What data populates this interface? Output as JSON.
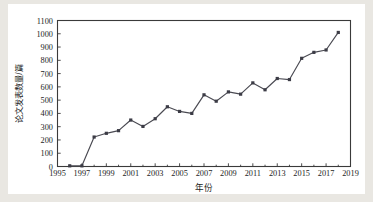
{
  "figure": {
    "background_color": "#ffffff",
    "page_background_color": "#e9e7e2",
    "axis_color": "#3a3a3a",
    "series_color": "#4a4a52",
    "marker_color": "#3c3c46"
  },
  "chart_data": {
    "type": "line",
    "title": "",
    "subtitle": "",
    "xlabel": "年份",
    "ylabel": "论文发表数量/篇",
    "xlim": [
      1995,
      2019
    ],
    "ylim": [
      0,
      1100
    ],
    "grid": false,
    "legend": null,
    "legend_position": "none",
    "marker": "square",
    "x_tick_labels": [
      "1995",
      "1997",
      "1999",
      "2001",
      "2003",
      "2005",
      "2007",
      "2009",
      "2011",
      "2013",
      "2015",
      "2017",
      "2019"
    ],
    "x_tick_values": [
      1995,
      1997,
      1999,
      2001,
      2003,
      2005,
      2007,
      2009,
      2011,
      2013,
      2015,
      2017,
      2019
    ],
    "x_minor_tick_values": [
      1996,
      1998,
      2000,
      2002,
      2004,
      2006,
      2008,
      2010,
      2012,
      2014,
      2016,
      2018
    ],
    "y_tick_labels": [
      "0",
      "100",
      "200",
      "300",
      "400",
      "500",
      "600",
      "700",
      "800",
      "900",
      "1000",
      "1100"
    ],
    "y_tick_values": [
      0,
      100,
      200,
      300,
      400,
      500,
      600,
      700,
      800,
      900,
      1000,
      1100
    ],
    "x": [
      1996,
      1997,
      1998,
      1999,
      2000,
      2001,
      2002,
      2003,
      2004,
      2005,
      2006,
      2007,
      2008,
      2009,
      2010,
      2011,
      2012,
      2013,
      2014,
      2015,
      2016,
      2017,
      2018
    ],
    "values": [
      5,
      5,
      222,
      250,
      270,
      350,
      302,
      360,
      450,
      415,
      400,
      540,
      492,
      562,
      545,
      630,
      578,
      663,
      655,
      815,
      860,
      878,
      1010
    ],
    "series": [
      {
        "name": "论文发表数量",
        "x": [
          1996,
          1997,
          1998,
          1999,
          2000,
          2001,
          2002,
          2003,
          2004,
          2005,
          2006,
          2007,
          2008,
          2009,
          2010,
          2011,
          2012,
          2013,
          2014,
          2015,
          2016,
          2017,
          2018
        ],
        "values": [
          5,
          5,
          222,
          250,
          270,
          350,
          302,
          360,
          450,
          415,
          400,
          540,
          492,
          562,
          545,
          630,
          578,
          663,
          655,
          815,
          860,
          878,
          1010
        ]
      }
    ],
    "annotations": []
  }
}
